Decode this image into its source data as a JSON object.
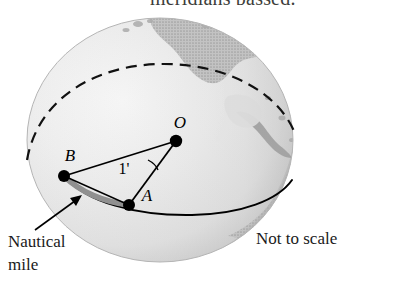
{
  "figure": {
    "title_clipped": "meridians passed.",
    "background_color": "#ffffff",
    "globe": {
      "ocean_fill": "#e8e8e8",
      "ocean_highlight": "#f6f6f6",
      "land_fill": "#bdbdbd",
      "land_fill_dark": "#a8a8a8",
      "edge_shadow": "#c9c9c9",
      "outline_color": "#b0b0b0",
      "center_x": 160,
      "center_y": 140,
      "radius_x": 133,
      "radius_y": 122
    },
    "great_circle": {
      "back_arc_style": "dashed",
      "front_arc_style": "solid",
      "stroke_color": "#000000"
    },
    "highlight_arc": {
      "label": "Nautical mile",
      "color": "#8c8c8c",
      "from_point": "B",
      "to_point": "A"
    },
    "points": [
      {
        "id": "O",
        "label": "O",
        "x": 176,
        "y": 141,
        "label_x": 180,
        "label_y": 128
      },
      {
        "id": "B",
        "label": "B",
        "x": 64,
        "y": 176,
        "label_x": 70,
        "label_y": 161
      },
      {
        "id": "A",
        "label": "A",
        "x": 129,
        "y": 205,
        "label_x": 147,
        "label_y": 201
      }
    ],
    "angle": {
      "vertex": "O",
      "label": "1'",
      "label_x": 124,
      "label_y": 174,
      "description": "one minute of arc"
    },
    "annotations": [
      {
        "id": "nautical-mile-callout",
        "line1": "Nautical",
        "line2": "mile",
        "x": 8,
        "y": 246,
        "has_arrow": true
      },
      {
        "id": "scale-note",
        "text": "Not to scale",
        "x": 256,
        "y": 243
      }
    ]
  }
}
